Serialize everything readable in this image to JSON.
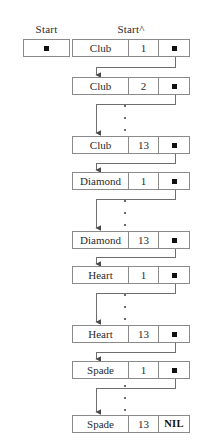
{
  "figure": {
    "type": "linked-list-diagram",
    "background_color": "#ffffff",
    "line_color": "#8a8a8a",
    "ink_color": "#1a1a1a"
  },
  "labels": {
    "start": "Start",
    "start_deref": "Start^"
  },
  "start_pointer": {
    "name": "start-pointer-box",
    "glyph": "filled-square-pointer"
  },
  "columns": {
    "suit_header": "suit",
    "rank_header": "rank",
    "pointer_header": "next"
  },
  "nodes": [
    {
      "suit": "Club",
      "rank": "1",
      "pointer": "■",
      "is_nil": false,
      "top": 39
    },
    {
      "suit": "Club",
      "rank": "2",
      "pointer": "■",
      "is_nil": false,
      "top": 77
    },
    {
      "suit": "Club",
      "rank": "13",
      "pointer": "■",
      "is_nil": false,
      "top": 136
    },
    {
      "suit": "Diamond",
      "rank": "1",
      "pointer": "■",
      "is_nil": false,
      "top": 172
    },
    {
      "suit": "Diamond",
      "rank": "13",
      "pointer": "■",
      "is_nil": false,
      "top": 231
    },
    {
      "suit": "Heart",
      "rank": "1",
      "pointer": "■",
      "is_nil": false,
      "top": 266
    },
    {
      "suit": "Heart",
      "rank": "13",
      "pointer": "■",
      "is_nil": false,
      "top": 325
    },
    {
      "suit": "Spade",
      "rank": "1",
      "pointer": "■",
      "is_nil": false,
      "top": 361
    },
    {
      "suit": "Spade",
      "rank": "13",
      "pointer": "NIL",
      "is_nil": true,
      "top": 415
    }
  ],
  "ellipses": [
    {
      "name": "ellipsis-clubs",
      "top": 105,
      "count": 3
    },
    {
      "name": "ellipsis-diamonds",
      "top": 200,
      "count": 3
    },
    {
      "name": "ellipsis-hearts",
      "top": 294,
      "count": 3
    },
    {
      "name": "ellipsis-spades",
      "top": 385,
      "count": 3
    }
  ]
}
